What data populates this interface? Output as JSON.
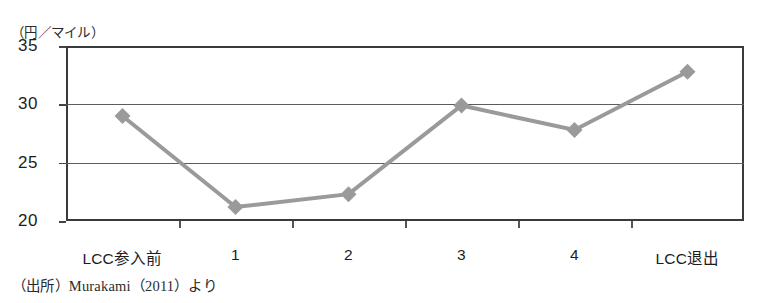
{
  "figure": {
    "y_unit_label": "（円／マイル）",
    "source_note": "（出所）Murakami（2011）より"
  },
  "chart_data": {
    "type": "line",
    "title": "",
    "subtitle": "",
    "xlabel": "",
    "ylabel": "（円／マイル）",
    "categories": [
      "LCC参入前",
      "1",
      "2",
      "3",
      "4",
      "LCC退出"
    ],
    "values": [
      29.0,
      21.2,
      22.3,
      29.9,
      27.8,
      32.8
    ],
    "series": [
      {
        "name": "運賃水準",
        "values": [
          29.0,
          21.2,
          22.3,
          29.9,
          27.8,
          32.8
        ]
      }
    ],
    "ylim": [
      20,
      35
    ],
    "yticks": [
      20,
      25,
      30,
      35
    ],
    "ytick_labels": [
      "20",
      "25",
      "30",
      "35"
    ],
    "grid": true,
    "grid_axis": "y",
    "legend": false,
    "legend_position": "none",
    "marker": "diamond",
    "marker_color": "#9a9a9a",
    "line_color": "#9a9a9a",
    "line_width": 4,
    "axis_color": "#3a3a3a",
    "annotations": []
  }
}
